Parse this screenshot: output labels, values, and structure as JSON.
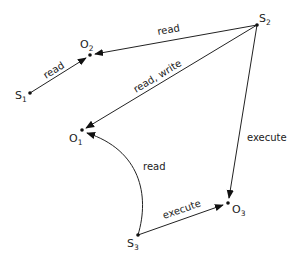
{
  "diagram": {
    "type": "access-control-graph",
    "nodes": [
      {
        "id": "S1",
        "base": "S",
        "sub": "1",
        "kind": "subject",
        "x": 30,
        "y": 93
      },
      {
        "id": "S2",
        "base": "S",
        "sub": "2",
        "kind": "subject",
        "x": 257,
        "y": 25
      },
      {
        "id": "S3",
        "base": "S",
        "sub": "3",
        "kind": "subject",
        "x": 138,
        "y": 235
      },
      {
        "id": "O1",
        "base": "O",
        "sub": "1",
        "kind": "object",
        "x": 82,
        "y": 130
      },
      {
        "id": "O2",
        "base": "O",
        "sub": "2",
        "kind": "object",
        "x": 90,
        "y": 55
      },
      {
        "id": "O3",
        "base": "O",
        "sub": "3",
        "kind": "object",
        "x": 228,
        "y": 203
      }
    ],
    "edges": [
      {
        "from": "S1",
        "to": "O2",
        "label": "read"
      },
      {
        "from": "S2",
        "to": "O2",
        "label": "read"
      },
      {
        "from": "S2",
        "to": "O1",
        "label": "read, write"
      },
      {
        "from": "S2",
        "to": "O3",
        "label": "execute"
      },
      {
        "from": "S3",
        "to": "O1",
        "label": "read",
        "curved": true
      },
      {
        "from": "S3",
        "to": "O3",
        "label": "execute"
      }
    ]
  },
  "labels": {
    "s1_base": "S",
    "s1_sub": "1",
    "s2_base": "S",
    "s2_sub": "2",
    "s3_base": "S",
    "s3_sub": "3",
    "o1_base": "O",
    "o1_sub": "1",
    "o2_base": "O",
    "o2_sub": "2",
    "o3_base": "O",
    "o3_sub": "3",
    "e_s1_o2": "read",
    "e_s2_o2": "read",
    "e_s2_o1": "read, write",
    "e_s2_o3": "execute",
    "e_s3_o1": "read",
    "e_s3_o3": "execute"
  },
  "colors": {
    "ink": "#222222",
    "background": "#ffffff"
  }
}
